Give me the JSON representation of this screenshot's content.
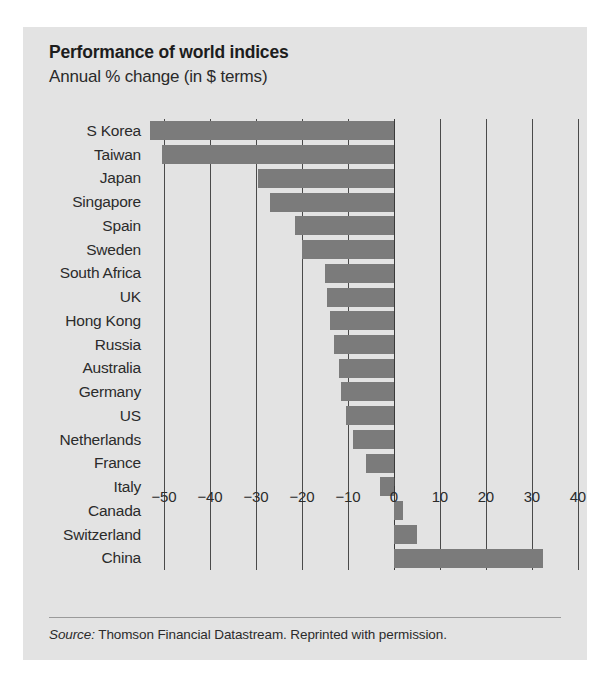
{
  "chart_data": {
    "type": "bar",
    "orientation": "horizontal",
    "title": "Performance of world indices",
    "subtitle": "Annual % change (in $ terms)",
    "xlabel": "",
    "ylabel": "",
    "xlim": [
      -55,
      42
    ],
    "grid": true,
    "legend": null,
    "xticks": [
      -50,
      -40,
      -30,
      -20,
      -10,
      0,
      10,
      20,
      30,
      40
    ],
    "xtick_labels": [
      "−50",
      "−40",
      "−30",
      "−20",
      "−10",
      "0",
      "10",
      "20",
      "30",
      "40"
    ],
    "categories": [
      "S Korea",
      "Taiwan",
      "Japan",
      "Singapore",
      "Spain",
      "Sweden",
      "South Africa",
      "UK",
      "Hong Kong",
      "Russia",
      "Australia",
      "Germany",
      "US",
      "Netherlands",
      "France",
      "Italy",
      "Canada",
      "Switzerland",
      "China"
    ],
    "values": [
      -53,
      -50.5,
      -29.5,
      -27,
      -21.5,
      -20,
      -15,
      -14.5,
      -14,
      -13,
      -12,
      -11.5,
      -10.5,
      -9,
      -6,
      -3,
      2,
      5,
      32.5
    ],
    "bar_color": "#7b7b7b",
    "background_color": "#e3e3e3",
    "axis_color": "#4a4a4a"
  },
  "source": {
    "prefix": "Source:",
    "text": "Thomson Financial Datastream. Reprinted with permission."
  }
}
